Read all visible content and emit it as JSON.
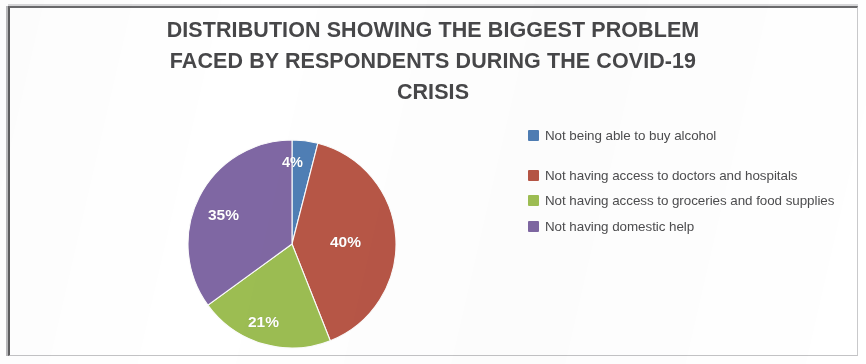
{
  "chart_data": {
    "type": "pie",
    "title": "DISTRIBUTION SHOWING THE BIGGEST PROBLEM FACED BY RESPONDENTS DURING THE COVID-19 CRISIS",
    "title_lines": [
      "DISTRIBUTION SHOWING THE BIGGEST PROBLEM",
      "FACED BY RESPONDENTS DURING THE COVID-19",
      "CRISIS"
    ],
    "categories": [
      "Not being able to buy alcohol",
      "Not having access to doctors and hospitals",
      "Not having access to groceries and food supplies",
      "Not having domestic help"
    ],
    "values": [
      4,
      40,
      21,
      35
    ],
    "value_labels": [
      "4%",
      "40%",
      "21%",
      "35%"
    ],
    "colors": [
      "#4a7ebb",
      "#bf5341",
      "#9cc049",
      "#8066a8"
    ],
    "units": "percent",
    "legend_position": "right",
    "start_angle_deg": 0,
    "direction": "clockwise",
    "data_label_color": "#ffffff",
    "title_color": "#474749",
    "legend_text_color": "#4d4d4f",
    "xlabel": "",
    "ylabel": "",
    "grid": false
  },
  "legend": {
    "items": [
      {
        "label": "Not being able to buy alcohol",
        "color": "#4a7ebb"
      },
      {
        "label": "Not having access to doctors and hospitals",
        "color": "#bf5341"
      },
      {
        "label": "Not having access to groceries and food supplies",
        "color": "#9cc049"
      },
      {
        "label": "Not having domestic help",
        "color": "#8066a8"
      }
    ]
  }
}
